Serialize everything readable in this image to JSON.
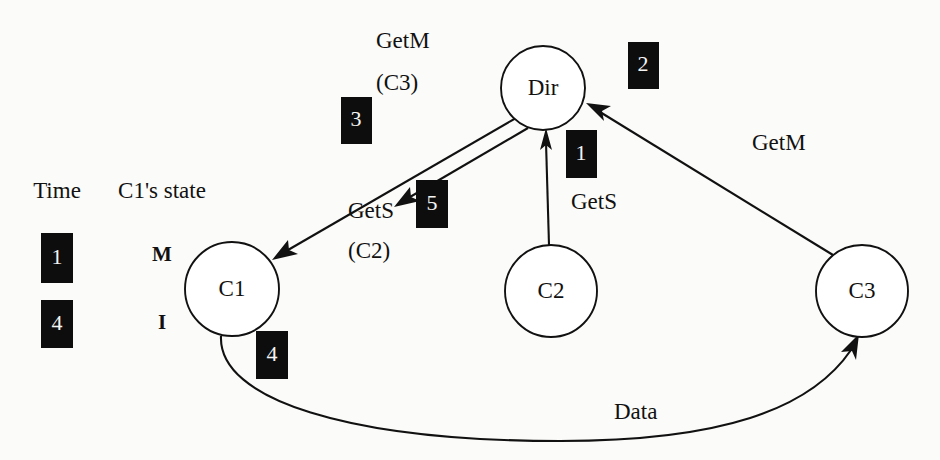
{
  "figure": {
    "background_color": "#fbfbf9",
    "ink_color": "#111111",
    "badge_color": "#0d0d0d",
    "badge_text_color": "#f4f4f4"
  },
  "legend": {
    "time_header": "Time",
    "state_header": "C1's state",
    "rows": [
      {
        "time": "1",
        "state": "M"
      },
      {
        "time": "4",
        "state": "I"
      }
    ]
  },
  "nodes": [
    {
      "id": "dir",
      "label": "Dir",
      "cx": 543,
      "cy": 88,
      "r": 42
    },
    {
      "id": "c1",
      "label": "C1",
      "cx": 232,
      "cy": 289,
      "r": 47
    },
    {
      "id": "c2",
      "label": "C2",
      "cx": 551,
      "cy": 291,
      "r": 46
    },
    {
      "id": "c3",
      "label": "C3",
      "cx": 862,
      "cy": 291,
      "r": 46
    }
  ],
  "edges": [
    {
      "id": "getm-c3-to-dir",
      "from": "c3",
      "to": "dir",
      "label": "GetM",
      "label_sub": "",
      "step": "2"
    },
    {
      "id": "gets-c2-to-dir",
      "from": "c2",
      "to": "dir",
      "label": "GetS",
      "label_sub": "",
      "step": "1"
    },
    {
      "id": "getm-dir-to-c1",
      "from": "dir",
      "to": "c1",
      "label": "GetM",
      "label_sub": "(C3)",
      "step": "3"
    },
    {
      "id": "gets-dir-to-c1",
      "from": "dir",
      "to": "c1",
      "label": "GetS",
      "label_sub": "(C2)",
      "step": "5"
    },
    {
      "id": "data-c1-to-c3",
      "from": "c1",
      "to": "c3",
      "label": "Data",
      "label_sub": "",
      "step": "4"
    }
  ],
  "labels": {
    "getm_c3": "GetM",
    "getm_c3_sub": "(C3)",
    "gets_c2": "GetS",
    "gets_c2_sub": "(C2)",
    "gets_right": "GetS",
    "getm_right": "GetM",
    "data": "Data"
  },
  "badges": [
    {
      "id": "badge-time-1",
      "value": "1",
      "x": 41,
      "y": 233
    },
    {
      "id": "badge-time-4",
      "value": "4",
      "x": 41,
      "y": 300
    },
    {
      "id": "badge-step-3",
      "value": "3",
      "x": 341,
      "y": 97
    },
    {
      "id": "badge-step-5",
      "value": "5",
      "x": 416,
      "y": 180
    },
    {
      "id": "badge-step-1",
      "value": "1",
      "x": 566,
      "y": 130
    },
    {
      "id": "badge-step-2",
      "value": "2",
      "x": 628,
      "y": 42
    },
    {
      "id": "badge-step-4",
      "value": "4",
      "x": 256,
      "y": 331
    }
  ]
}
